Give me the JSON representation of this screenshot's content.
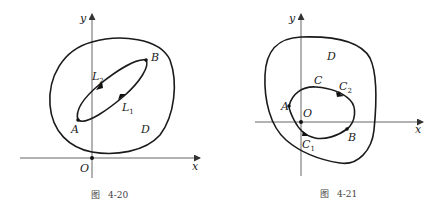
{
  "figures": [
    {
      "id": "fig-4-20",
      "caption_prefix": "图",
      "caption_number": "4-20",
      "axis_labels": {
        "x": "x",
        "y": "y"
      },
      "origin_label": "O",
      "region_label": "D",
      "points": {
        "A": "A",
        "B": "B"
      },
      "paths": [
        {
          "name": "L",
          "subscript": "2"
        },
        {
          "name": "L",
          "subscript": "1"
        }
      ]
    },
    {
      "id": "fig-4-21",
      "caption_prefix": "图",
      "caption_number": "4-21",
      "axis_labels": {
        "x": "x",
        "y": "y"
      },
      "origin_label": "O",
      "region_label": "D",
      "curve_label": "C",
      "points": {
        "A": "A",
        "B": "B"
      },
      "paths": [
        {
          "name": "C",
          "subscript": "2"
        },
        {
          "name": "C",
          "subscript": "1"
        }
      ]
    }
  ],
  "colors": {
    "curve": "#1a1a1a",
    "axis": "#555555",
    "background": "#ffffff"
  }
}
